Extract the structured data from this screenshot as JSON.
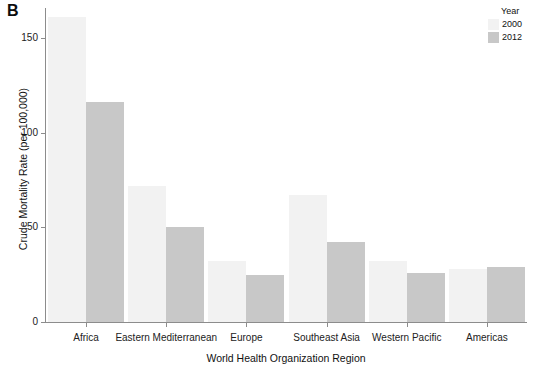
{
  "panel": {
    "label": "B"
  },
  "legend": {
    "title": "Year",
    "position": "top-right",
    "entries": [
      {
        "label": "2000",
        "color": "#f2f2f2"
      },
      {
        "label": "2012",
        "color": "#c8c8c8"
      }
    ]
  },
  "axes": {
    "y_title": "Crude Mortality Rate (per 100,000)",
    "x_title": "World Health Organization Region",
    "y_ticks": [
      "0",
      "50",
      "100",
      "150"
    ]
  },
  "chart_data": {
    "type": "bar",
    "title": "",
    "subtitle": "",
    "xlabel": "World Health Organization Region",
    "ylabel": "Crude Mortality Rate (per 100,000)",
    "categories": [
      "Africa",
      "Eastern Mediterranean",
      "Europe",
      "Southeast Asia",
      "Western Pacific",
      "Americas"
    ],
    "series": [
      {
        "name": "2000",
        "color": "#f2f2f2",
        "values": [
          161,
          72,
          32,
          67,
          32,
          28
        ]
      },
      {
        "name": "2012",
        "color": "#c8c8c8",
        "values": [
          116,
          50,
          25,
          42,
          26,
          29
        ]
      }
    ],
    "ylim": [
      0,
      170
    ],
    "yticks": [
      0,
      50,
      100,
      150
    ],
    "grid": false,
    "legend_title": "Year",
    "legend_position": "top-right",
    "bar_edge_color": "#e0e0e0",
    "axis_color": "#8c8c8c"
  }
}
